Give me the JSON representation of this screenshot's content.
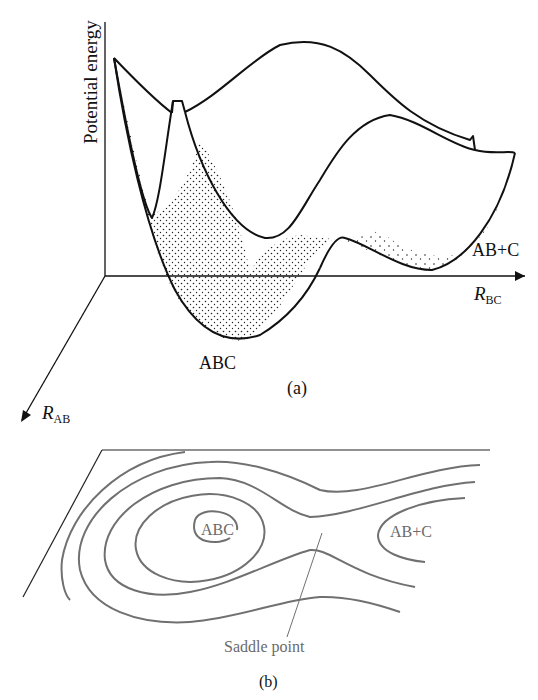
{
  "panel_a": {
    "caption": "(a)",
    "y_axis_label": "Potential energy",
    "x_axis_label_main": "R",
    "x_axis_label_sub": "BC",
    "z_axis_label_main": "R",
    "z_axis_label_sub": "AB",
    "reactant_label": "ABC",
    "product_label": "AB+C"
  },
  "panel_b": {
    "caption": "(b)",
    "reactant_label": "ABC",
    "product_label": "AB+C",
    "saddle_label": "Saddle point",
    "contour_color": "#707070"
  },
  "colors": {
    "line": "#111111",
    "contour": "#707070",
    "background": "#ffffff"
  }
}
